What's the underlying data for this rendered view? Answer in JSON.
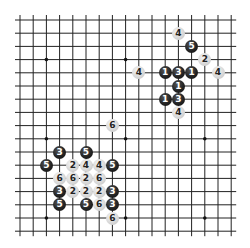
{
  "board": {
    "grid": {
      "lines": 17,
      "origin_x": 20,
      "origin_y": 20,
      "spacing": 13.2,
      "line_color": "#222222",
      "overhang": 5
    },
    "star_points": [
      [
        2,
        3
      ],
      [
        8,
        3
      ],
      [
        14,
        3
      ],
      [
        2,
        9
      ],
      [
        8,
        9
      ],
      [
        14,
        9
      ],
      [
        2,
        15
      ],
      [
        8,
        15
      ],
      [
        14,
        15
      ]
    ],
    "stones": [
      {
        "col": 12,
        "row": 1,
        "color": "white",
        "label": "4"
      },
      {
        "col": 13,
        "row": 2,
        "color": "black",
        "label": "5"
      },
      {
        "col": 14,
        "row": 3,
        "color": "white",
        "label": "2"
      },
      {
        "col": 9,
        "row": 4,
        "color": "white",
        "label": "4"
      },
      {
        "col": 11,
        "row": 4,
        "color": "black",
        "label": "1"
      },
      {
        "col": 12,
        "row": 4,
        "color": "black",
        "label": "3"
      },
      {
        "col": 13,
        "row": 4,
        "color": "black",
        "label": "1"
      },
      {
        "col": 15,
        "row": 4,
        "color": "white",
        "label": "4"
      },
      {
        "col": 12,
        "row": 5,
        "color": "black",
        "label": "1"
      },
      {
        "col": 11,
        "row": 6,
        "color": "black",
        "label": "1"
      },
      {
        "col": 12,
        "row": 6,
        "color": "black",
        "label": "3"
      },
      {
        "col": 12,
        "row": 7,
        "color": "white",
        "label": "4"
      },
      {
        "col": 7,
        "row": 8,
        "color": "white",
        "label": "6"
      },
      {
        "col": 3,
        "row": 10,
        "color": "black",
        "label": "3"
      },
      {
        "col": 5,
        "row": 10,
        "color": "black",
        "label": "5"
      },
      {
        "col": 2,
        "row": 11,
        "color": "black",
        "label": "5"
      },
      {
        "col": 4,
        "row": 11,
        "color": "white",
        "label": "2"
      },
      {
        "col": 5,
        "row": 11,
        "color": "white",
        "label": "4"
      },
      {
        "col": 6,
        "row": 11,
        "color": "white",
        "label": "4"
      },
      {
        "col": 7,
        "row": 11,
        "color": "black",
        "label": "5"
      },
      {
        "col": 3,
        "row": 12,
        "color": "white",
        "label": "6"
      },
      {
        "col": 4,
        "row": 12,
        "color": "white",
        "label": "6"
      },
      {
        "col": 5,
        "row": 12,
        "color": "white",
        "label": "2"
      },
      {
        "col": 6,
        "row": 12,
        "color": "white",
        "label": "6"
      },
      {
        "col": 3,
        "row": 13,
        "color": "black",
        "label": "3"
      },
      {
        "col": 4,
        "row": 13,
        "color": "white",
        "label": "2"
      },
      {
        "col": 5,
        "row": 13,
        "color": "white",
        "label": "2"
      },
      {
        "col": 6,
        "row": 13,
        "color": "white",
        "label": "2"
      },
      {
        "col": 7,
        "row": 13,
        "color": "black",
        "label": "3"
      },
      {
        "col": 3,
        "row": 14,
        "color": "black",
        "label": "5"
      },
      {
        "col": 5,
        "row": 14,
        "color": "black",
        "label": "5"
      },
      {
        "col": 6,
        "row": 14,
        "color": "white",
        "label": "6"
      },
      {
        "col": 7,
        "row": 14,
        "color": "black",
        "label": "3"
      },
      {
        "col": 7,
        "row": 15,
        "color": "white",
        "label": "6"
      }
    ]
  }
}
